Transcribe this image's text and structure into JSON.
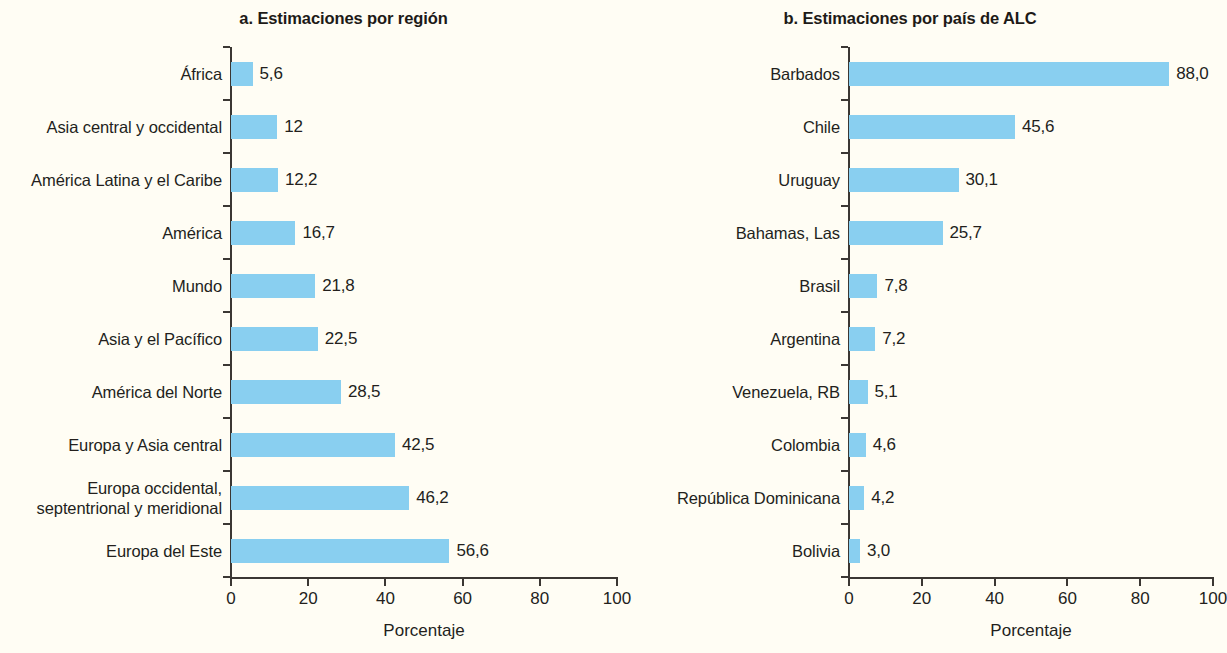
{
  "chart_data": [
    {
      "type": "bar",
      "orientation": "horizontal",
      "panel_id": "a",
      "title": "a. Estimaciones por región",
      "xlabel": "Porcentaje",
      "ylabel": "",
      "xlim": [
        0,
        100
      ],
      "xticks": [
        0,
        20,
        40,
        60,
        80,
        100
      ],
      "xticklabels": [
        "0",
        "20",
        "40",
        "60",
        "80",
        "100"
      ],
      "grid": false,
      "legend": "none",
      "bar_color": "#89cff0",
      "categories": [
        "África",
        "Asia central y occidental",
        "América Latina y el Caribe",
        "América",
        "Mundo",
        "Asia y el Pacífico",
        "América del Norte",
        "Europa y Asia central",
        "Europa occidental,\nseptentrional y meridional",
        "Europa del Este"
      ],
      "values": [
        5.6,
        12,
        12.2,
        16.7,
        21.8,
        22.5,
        28.5,
        42.5,
        46.2,
        56.6
      ],
      "value_labels": [
        "5,6",
        "12",
        "12,2",
        "16,7",
        "21,8",
        "22,5",
        "28,5",
        "42,5",
        "46,2",
        "56,6"
      ]
    },
    {
      "type": "bar",
      "orientation": "horizontal",
      "panel_id": "b",
      "title": "b. Estimaciones por país de ALC",
      "xlabel": "Porcentaje",
      "ylabel": "",
      "xlim": [
        0,
        100
      ],
      "xticks": [
        0,
        20,
        40,
        60,
        80,
        100
      ],
      "xticklabels": [
        "0",
        "20",
        "40",
        "60",
        "80",
        "100"
      ],
      "grid": false,
      "legend": "none",
      "bar_color": "#89cff0",
      "categories": [
        "Barbados",
        "Chile",
        "Uruguay",
        "Bahamas, Las",
        "Brasil",
        "Argentina",
        "Venezuela, RB",
        "Colombia",
        "República Dominicana",
        "Bolivia"
      ],
      "values": [
        88.0,
        45.6,
        30.1,
        25.7,
        7.8,
        7.2,
        5.1,
        4.6,
        4.2,
        3.0
      ],
      "value_labels": [
        "88,0",
        "45,6",
        "30,1",
        "25,7",
        "7,8",
        "7,2",
        "5,1",
        "4,6",
        "4,2",
        "3,0"
      ]
    }
  ]
}
